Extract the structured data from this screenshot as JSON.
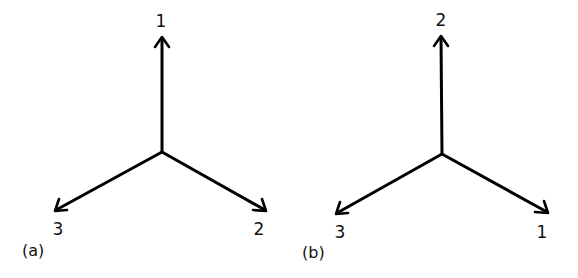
{
  "panels": [
    {
      "caption": "(a)",
      "axes": [
        {
          "label": "1",
          "direction": "up"
        },
        {
          "label": "2",
          "direction": "lower-right"
        },
        {
          "label": "3",
          "direction": "lower-left"
        }
      ]
    },
    {
      "caption": "(b)",
      "axes": [
        {
          "label": "2",
          "direction": "up"
        },
        {
          "label": "1",
          "direction": "lower-right"
        },
        {
          "label": "3",
          "direction": "lower-left"
        }
      ]
    }
  ]
}
